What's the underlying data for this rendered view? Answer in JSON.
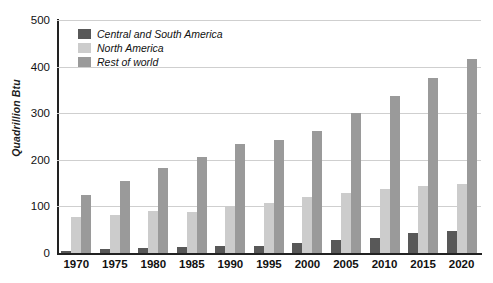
{
  "chart_data": {
    "type": "bar",
    "title": "",
    "xlabel": "",
    "ylabel": "Quadrillion Btu",
    "ylim": [
      0,
      500
    ],
    "yticks": [
      0,
      100,
      200,
      300,
      400,
      500
    ],
    "grid": true,
    "legend_position": "top-left",
    "categories": [
      "1970",
      "1975",
      "1980",
      "1985",
      "1990",
      "1995",
      "2000",
      "2005",
      "2010",
      "2015",
      "2020"
    ],
    "series": [
      {
        "name": "Central and South America",
        "color": "#585858",
        "values": [
          5,
          8,
          11,
          12,
          14,
          16,
          21,
          28,
          33,
          42,
          47
        ]
      },
      {
        "name": "North America",
        "color": "#cccccc",
        "values": [
          77,
          82,
          91,
          89,
          101,
          108,
          121,
          128,
          137,
          143,
          149
        ]
      },
      {
        "name": "Rest of world",
        "color": "#9a9a9a",
        "values": [
          125,
          155,
          183,
          207,
          234,
          243,
          262,
          301,
          336,
          375,
          417
        ]
      }
    ]
  }
}
